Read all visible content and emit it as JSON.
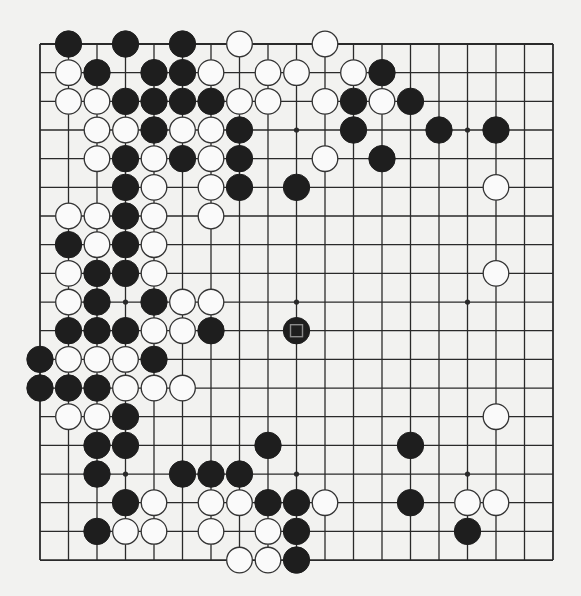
{
  "board": {
    "size": 19,
    "origin_x": 40,
    "origin_y": 44,
    "spacing_x": 28.5,
    "spacing_y": 28.67,
    "stone_radius": 13.2,
    "colors": {
      "background": "#f2f2f0",
      "line": "#2a2a2a",
      "black_stone": "#1e1e1e",
      "white_stone": "#fafafa",
      "white_stone_outline": "#333333",
      "marker": "#8a8a8a"
    },
    "star_points": [
      [
        3,
        3
      ],
      [
        9,
        3
      ],
      [
        15,
        3
      ],
      [
        3,
        9
      ],
      [
        9,
        9
      ],
      [
        15,
        9
      ],
      [
        3,
        15
      ],
      [
        9,
        15
      ],
      [
        15,
        15
      ]
    ],
    "last_move_marker": {
      "col": 9,
      "row": 10,
      "shape": "square"
    },
    "stones": [
      {
        "row": 0,
        "black": [
          1,
          3,
          5
        ],
        "white": [
          7,
          10
        ]
      },
      {
        "row": 1,
        "black": [
          2,
          4,
          5,
          12
        ],
        "white": [
          1,
          6,
          8,
          9,
          11
        ]
      },
      {
        "row": 2,
        "black": [
          3,
          4,
          5,
          6,
          11,
          13
        ],
        "white": [
          1,
          2,
          7,
          8,
          10,
          12
        ]
      },
      {
        "row": 3,
        "black": [
          4,
          7,
          11,
          14,
          16
        ],
        "white": [
          2,
          3,
          5,
          6
        ]
      },
      {
        "row": 4,
        "black": [
          3,
          5,
          7,
          12
        ],
        "white": [
          2,
          4,
          6,
          10
        ]
      },
      {
        "row": 5,
        "black": [
          3,
          7,
          9
        ],
        "white": [
          4,
          6,
          16
        ]
      },
      {
        "row": 6,
        "black": [
          3
        ],
        "white": [
          1,
          2,
          4,
          6
        ]
      },
      {
        "row": 7,
        "black": [
          1,
          3
        ],
        "white": [
          2,
          4
        ]
      },
      {
        "row": 8,
        "black": [
          2,
          3
        ],
        "white": [
          1,
          4,
          16
        ]
      },
      {
        "row": 9,
        "black": [
          2,
          4
        ],
        "white": [
          1,
          5,
          6
        ]
      },
      {
        "row": 10,
        "black": [
          1,
          2,
          3,
          6,
          9
        ],
        "white": [
          4,
          5
        ]
      },
      {
        "row": 11,
        "black": [
          0,
          4
        ],
        "white": [
          1,
          2,
          3
        ]
      },
      {
        "row": 12,
        "black": [
          0,
          1,
          2
        ],
        "white": [
          3,
          4,
          5
        ]
      },
      {
        "row": 13,
        "black": [
          3
        ],
        "white": [
          1,
          2,
          16
        ]
      },
      {
        "row": 14,
        "black": [
          2,
          3,
          8,
          13
        ],
        "white": []
      },
      {
        "row": 15,
        "black": [
          2,
          5,
          6,
          7
        ],
        "white": []
      },
      {
        "row": 16,
        "black": [
          3,
          8,
          9,
          13
        ],
        "white": [
          4,
          6,
          7,
          10,
          15,
          16
        ]
      },
      {
        "row": 17,
        "black": [
          2,
          9,
          15
        ],
        "white": [
          3,
          4,
          6,
          8
        ]
      },
      {
        "row": 18,
        "black": [
          9
        ],
        "white": [
          7,
          8
        ]
      }
    ]
  }
}
